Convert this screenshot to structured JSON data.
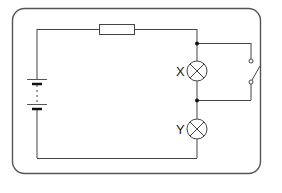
{
  "diagram": {
    "type": "circuit",
    "components": {
      "battery": {
        "cells": 2,
        "label": ""
      },
      "resistor": {
        "label": ""
      },
      "lamp_x": {
        "label": "X"
      },
      "lamp_y": {
        "label": "Y"
      },
      "switch": {
        "state": "open",
        "label": ""
      }
    },
    "colors": {
      "wire": "#444444",
      "border": "#555555",
      "background": "#ffffff"
    }
  }
}
